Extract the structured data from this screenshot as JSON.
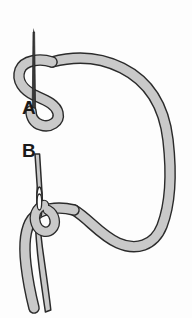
{
  "diagram": {
    "background_color": "#fdfdfd",
    "thread": {
      "fill_color": "#c9c9c9",
      "outline_color": "#2b2b2b",
      "width_px": 9,
      "outline_width_px": 1.4,
      "description": "Light grey thread with dark outline forming a large loop"
    },
    "needle": {
      "fill_color": "#c9c9c9",
      "outline_color": "#2b2b2b",
      "line_color": "#1f1f1f",
      "description": "Sewing needle shown passing through the thread loop"
    },
    "labels": [
      {
        "id": "label-a",
        "text": "A",
        "x": 22,
        "y": 114,
        "font_size": 19,
        "describes": "needle passing through S-shaped thread loop"
      },
      {
        "id": "label-b",
        "text": "B",
        "x": 22,
        "y": 157,
        "font_size": 19,
        "describes": "needle eye with thread drawn through"
      }
    ],
    "steps": [
      {
        "key": "A",
        "label": "A",
        "caption": "Needle inserted through the looped thread"
      },
      {
        "key": "B",
        "label": "B",
        "caption": "Thread pulled through the needle eye"
      }
    ]
  }
}
